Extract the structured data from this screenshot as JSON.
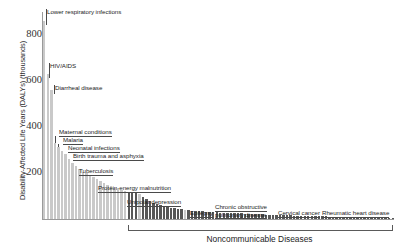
{
  "chart_data": {
    "type": "bar",
    "title": "",
    "subtitle": "",
    "xlabel": "",
    "ylabel": "Disability-Affected Life Years (DALYs) (thousands)",
    "ylim": [
      0,
      900
    ],
    "yticks": [
      200,
      400,
      600,
      800
    ],
    "ytick_labels": [
      "200",
      "400",
      "600",
      "800"
    ],
    "grid": false,
    "legend_position": "none",
    "units": "thousands of DALYs",
    "series": [
      {
        "name": "Communicable, maternal, perinatal and nutritional conditions",
        "color": "#c9c9c9"
      },
      {
        "name": "Noncommunicable Diseases",
        "color": "#575757"
      }
    ],
    "categories": [
      "Lower respiratory infections",
      "HIV/AIDS",
      "Diarrheal disease",
      "Maternal conditions",
      "Malaria",
      "Neonatal infections",
      "Birth trauma and asphyxia",
      "Tuberculosis",
      "Protein-energy malnutrition",
      "Unipolar depression",
      "Epilepsy",
      "Chronic obstructive pulmonary disease",
      "Cervical cancer",
      "Rheumatic heart disease"
    ],
    "values": [
      860,
      630,
      560,
      300,
      290,
      280,
      265,
      200,
      150,
      118,
      95,
      88,
      40,
      22
    ],
    "bars": [
      {
        "group": "communicable",
        "value": 860
      },
      {
        "group": "communicable",
        "value": 632
      },
      {
        "group": "communicable",
        "value": 560
      },
      {
        "group": "communicable",
        "value": 330
      },
      {
        "group": "communicable",
        "value": 312
      },
      {
        "group": "communicable",
        "value": 296
      },
      {
        "group": "communicable",
        "value": 282
      },
      {
        "group": "communicable",
        "value": 262
      },
      {
        "group": "communicable",
        "value": 244
      },
      {
        "group": "communicable",
        "value": 230
      },
      {
        "group": "communicable",
        "value": 216
      },
      {
        "group": "communicable",
        "value": 206
      },
      {
        "group": "communicable",
        "value": 198
      },
      {
        "group": "communicable",
        "value": 190
      },
      {
        "group": "communicable",
        "value": 182
      },
      {
        "group": "communicable",
        "value": 174
      },
      {
        "group": "communicable",
        "value": 166
      },
      {
        "group": "communicable",
        "value": 158
      },
      {
        "group": "communicable",
        "value": 150
      },
      {
        "group": "communicable",
        "value": 142
      },
      {
        "group": "communicable",
        "value": 136
      },
      {
        "group": "communicable",
        "value": 130
      },
      {
        "group": "communicable",
        "value": 124
      },
      {
        "group": "communicable",
        "value": 120
      },
      {
        "group": "noncommunicable",
        "value": 118
      },
      {
        "group": "noncommunicable",
        "value": 115
      },
      {
        "group": "noncommunicable",
        "value": 112
      },
      {
        "group": "communicable",
        "value": 108
      },
      {
        "group": "noncommunicable",
        "value": 96
      },
      {
        "group": "noncommunicable",
        "value": 86
      },
      {
        "group": "noncommunicable",
        "value": 78
      },
      {
        "group": "noncommunicable",
        "value": 70
      },
      {
        "group": "noncommunicable",
        "value": 64
      },
      {
        "group": "noncommunicable",
        "value": 60
      },
      {
        "group": "noncommunicable",
        "value": 56
      },
      {
        "group": "noncommunicable",
        "value": 52
      },
      {
        "group": "noncommunicable",
        "value": 49
      },
      {
        "group": "noncommunicable",
        "value": 46
      },
      {
        "group": "noncommunicable",
        "value": 44
      },
      {
        "group": "noncommunicable",
        "value": 42
      },
      {
        "group": "communicable",
        "value": 40
      },
      {
        "group": "noncommunicable",
        "value": 38
      },
      {
        "group": "noncommunicable",
        "value": 36
      },
      {
        "group": "noncommunicable",
        "value": 35
      },
      {
        "group": "noncommunicable",
        "value": 34
      },
      {
        "group": "noncommunicable",
        "value": 33
      },
      {
        "group": "noncommunicable",
        "value": 32
      },
      {
        "group": "noncommunicable",
        "value": 31
      },
      {
        "group": "noncommunicable",
        "value": 30
      },
      {
        "group": "noncommunicable",
        "value": 29
      },
      {
        "group": "noncommunicable",
        "value": 28
      },
      {
        "group": "noncommunicable",
        "value": 27
      },
      {
        "group": "noncommunicable",
        "value": 26
      },
      {
        "group": "noncommunicable",
        "value": 26
      },
      {
        "group": "noncommunicable",
        "value": 25
      },
      {
        "group": "noncommunicable",
        "value": 24
      },
      {
        "group": "noncommunicable",
        "value": 24
      },
      {
        "group": "noncommunicable",
        "value": 23
      },
      {
        "group": "noncommunicable",
        "value": 22
      },
      {
        "group": "noncommunicable",
        "value": 22
      },
      {
        "group": "noncommunicable",
        "value": 21
      },
      {
        "group": "noncommunicable",
        "value": 20
      },
      {
        "group": "noncommunicable",
        "value": 20
      },
      {
        "group": "noncommunicable",
        "value": 19
      },
      {
        "group": "noncommunicable",
        "value": 19
      },
      {
        "group": "noncommunicable",
        "value": 18
      },
      {
        "group": "noncommunicable",
        "value": 18
      },
      {
        "group": "noncommunicable",
        "value": 17
      },
      {
        "group": "noncommunicable",
        "value": 17
      },
      {
        "group": "noncommunicable",
        "value": 16
      },
      {
        "group": "noncommunicable",
        "value": 16
      },
      {
        "group": "noncommunicable",
        "value": 15
      },
      {
        "group": "noncommunicable",
        "value": 15
      },
      {
        "group": "noncommunicable",
        "value": 14
      },
      {
        "group": "noncommunicable",
        "value": 14
      },
      {
        "group": "noncommunicable",
        "value": 13
      },
      {
        "group": "noncommunicable",
        "value": 13
      },
      {
        "group": "noncommunicable",
        "value": 12
      },
      {
        "group": "noncommunicable",
        "value": 12
      },
      {
        "group": "noncommunicable",
        "value": 11
      },
      {
        "group": "noncommunicable",
        "value": 11
      },
      {
        "group": "noncommunicable",
        "value": 10
      },
      {
        "group": "noncommunicable",
        "value": 10
      },
      {
        "group": "noncommunicable",
        "value": 9
      },
      {
        "group": "noncommunicable",
        "value": 9
      },
      {
        "group": "noncommunicable",
        "value": 9
      },
      {
        "group": "noncommunicable",
        "value": 8
      },
      {
        "group": "noncommunicable",
        "value": 8
      },
      {
        "group": "noncommunicable",
        "value": 8
      },
      {
        "group": "noncommunicable",
        "value": 7
      },
      {
        "group": "noncommunicable",
        "value": 7
      },
      {
        "group": "noncommunicable",
        "value": 7
      },
      {
        "group": "noncommunicable",
        "value": 6
      },
      {
        "group": "noncommunicable",
        "value": 6
      },
      {
        "group": "noncommunicable",
        "value": 6
      },
      {
        "group": "noncommunicable",
        "value": 5
      },
      {
        "group": "noncommunicable",
        "value": 5
      },
      {
        "group": "noncommunicable",
        "value": 5
      },
      {
        "group": "noncommunicable",
        "value": 4
      },
      {
        "group": "noncommunicable",
        "value": 4
      }
    ],
    "annotations": [
      {
        "label": "Lower respiratory infections",
        "bar_index": 0,
        "x": 47,
        "y": 9,
        "style": "vline",
        "lead_h": 0
      },
      {
        "label": "HIV/AIDS",
        "bar_index": 1,
        "x": 50,
        "y": 63,
        "style": "vline",
        "lead_h": 0
      },
      {
        "label": "Diarrheal disease",
        "bar_index": 2,
        "x": 55,
        "y": 85,
        "style": "vline",
        "lead_h": 0
      },
      {
        "label": "Maternal conditions",
        "bar_index": 3,
        "x": 59,
        "y": 129,
        "style": "under",
        "lead_h": 0
      },
      {
        "label": "Malaria",
        "bar_index": 4,
        "x": 63,
        "y": 137,
        "style": "under",
        "lead_h": 0
      },
      {
        "label": "Neonatal infections",
        "bar_index": 5,
        "x": 68,
        "y": 145,
        "style": "under",
        "lead_h": 0
      },
      {
        "label": "Birth trauma and asphyxia",
        "bar_index": 6,
        "x": 73,
        "y": 153,
        "style": "under",
        "lead_h": 0
      },
      {
        "label": "Tuberculosis",
        "bar_index": 7,
        "x": 79,
        "y": 168,
        "style": "under",
        "lead_h": 0
      },
      {
        "label": "Protein-energy malnutrition",
        "bar_index": 8,
        "x": 98,
        "y": 185,
        "style": "under",
        "lead_h": 0
      },
      {
        "label": "Unipolar depression",
        "bar_index": 24,
        "x": 127,
        "y": 199,
        "style": "under",
        "lead_h": 0
      },
      {
        "label": "Epilepsy",
        "bar_index": 28,
        "x": 190,
        "y": 210,
        "style": "under",
        "lead_h": 0
      },
      {
        "label": "Chronic obstructive\npulmonary disease",
        "bar_index": 31,
        "x": 215,
        "y": 204,
        "style": "under",
        "lead_h": 0
      },
      {
        "label": "Cervical cancer",
        "bar_index": 40,
        "x": 278,
        "y": 210,
        "style": "under",
        "lead_h": 0
      },
      {
        "label": "Rheumatic heart disease",
        "bar_index": 60,
        "x": 322,
        "y": 210,
        "style": "under",
        "lead_h": 0
      }
    ],
    "bracket": {
      "label": "Noncommunicable Diseases",
      "x_start": 128,
      "x_end": 391
    }
  }
}
